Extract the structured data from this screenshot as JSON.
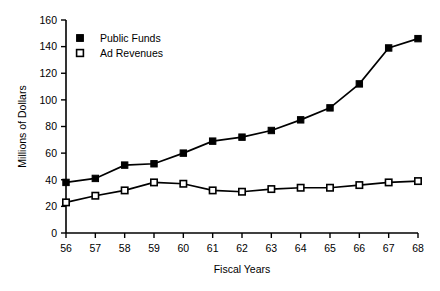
{
  "chart_data": {
    "type": "line",
    "title": "",
    "xlabel": "Fiscal Years",
    "ylabel": "Millions of Dollars",
    "categories": [
      "56",
      "57",
      "58",
      "59",
      "60",
      "61",
      "62",
      "63",
      "64",
      "65",
      "66",
      "67",
      "68"
    ],
    "x": [
      56,
      57,
      58,
      59,
      60,
      61,
      62,
      63,
      64,
      65,
      66,
      67,
      68
    ],
    "xlim": [
      56,
      68
    ],
    "ylim": [
      0,
      160
    ],
    "yticks": [
      0,
      20,
      40,
      60,
      80,
      100,
      120,
      140,
      160
    ],
    "ytick_labels": [
      "0",
      "20",
      "40",
      "60",
      "80",
      "100",
      "120",
      "140",
      "160"
    ],
    "xtick_labels": [
      "56",
      "57",
      "58",
      "59",
      "60",
      "61",
      "62",
      "63",
      "64",
      "65",
      "66",
      "67",
      "68"
    ],
    "grid": false,
    "legend_position": "top-left-inside",
    "series": [
      {
        "name": "Public Funds",
        "marker": "filled-square",
        "color": "#000000",
        "values": [
          38,
          41,
          51,
          52,
          60,
          69,
          72,
          77,
          85,
          94,
          112,
          139,
          146
        ]
      },
      {
        "name": "Ad Revenues",
        "marker": "open-square",
        "color": "#000000",
        "values": [
          23,
          28,
          32,
          38,
          37,
          32,
          31,
          33,
          34,
          34,
          36,
          38,
          39
        ]
      }
    ]
  },
  "legend": {
    "items": [
      {
        "label": "Public Funds",
        "marker": "filled-square"
      },
      {
        "label": "Ad Revenues",
        "marker": "open-square"
      }
    ]
  },
  "colors": {
    "foreground": "#000000",
    "background": "#ffffff",
    "marker_open_fill": "#ffffff"
  }
}
